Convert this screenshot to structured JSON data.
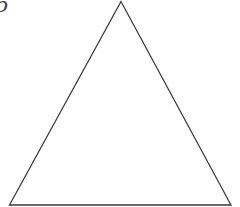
{
  "figure": {
    "label": "6",
    "shape": "triangle",
    "stroke_color": "#3a3a3a",
    "background": "#ffffff",
    "vertices": {
      "apex": [
        121,
        1.5
      ],
      "bottom_left": [
        9.5,
        205
      ],
      "bottom_right": [
        231,
        205
      ]
    }
  }
}
